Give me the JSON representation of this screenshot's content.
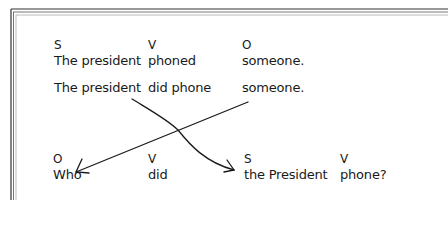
{
  "diagram": {
    "sentence1": {
      "labels": {
        "s": "S",
        "v": "V",
        "o": "O"
      },
      "subject": "The president",
      "verb": "phoned",
      "object": "someone."
    },
    "sentence2": {
      "subject": "The president",
      "verb": "did phone",
      "object": "someone."
    },
    "question": {
      "labels": {
        "o": "O",
        "v1": "V",
        "s": "S",
        "v2": "V"
      },
      "object": "Who",
      "aux": "did",
      "subject": "the President",
      "verb": "phone?"
    },
    "arrows": [
      {
        "from": "sentence2.subject",
        "to": "question.subject",
        "shape": "curve"
      },
      {
        "from": "sentence2.object",
        "to": "question.object",
        "shape": "straight"
      }
    ],
    "colors": {
      "ink": "#1a1a1a",
      "frame": "#555555",
      "background": "#ffffff"
    }
  }
}
